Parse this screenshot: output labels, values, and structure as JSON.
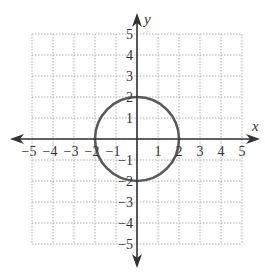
{
  "chart_data": {
    "type": "line",
    "title": "",
    "xlabel": "x",
    "ylabel": "y",
    "xlim": [
      -5,
      5
    ],
    "ylim": [
      -5,
      5
    ],
    "grid": true,
    "grid_style": "dotted",
    "x_ticks": [
      -5,
      -4,
      -3,
      -2,
      -1,
      1,
      2,
      3,
      4,
      5
    ],
    "y_ticks": [
      5,
      4,
      3,
      2,
      1,
      -1,
      -2,
      -3,
      -4,
      -5
    ],
    "x_tick_labels": [
      "−5",
      "−4",
      "−3",
      "−2",
      "−1",
      "1",
      "2",
      "3",
      "4",
      "5"
    ],
    "y_tick_labels": [
      "5",
      "4",
      "3",
      "2",
      "1",
      "−1",
      "−2",
      "−3",
      "−4",
      "−5"
    ],
    "series": [
      {
        "name": "circle",
        "shape": "circle",
        "center": [
          0,
          0
        ],
        "radius": 2,
        "equation": "x^2 + y^2 = 4",
        "color": "#555555"
      }
    ],
    "legend": null
  },
  "colors": {
    "axis": "#333333",
    "grid": "#b0b0b0",
    "curve": "#5a5a5a"
  }
}
